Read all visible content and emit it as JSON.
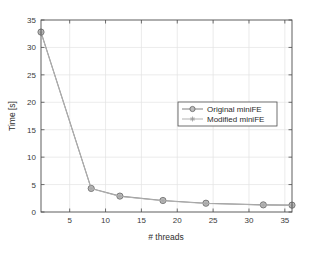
{
  "chart_data": {
    "type": "line",
    "title": "",
    "xlabel": "# threads",
    "ylabel": "Time [s]",
    "xlim": [
      1,
      36
    ],
    "ylim": [
      0,
      35
    ],
    "xticks": [
      5,
      10,
      15,
      20,
      25,
      30,
      35
    ],
    "xtick_labels": [
      "5",
      "10",
      "15",
      "20",
      "25",
      "30",
      "35"
    ],
    "yticks": [
      0,
      5,
      10,
      15,
      20,
      25,
      30,
      35
    ],
    "ytick_labels": [
      "0",
      "5",
      "10",
      "15",
      "20",
      "25",
      "30",
      "35"
    ],
    "grid": true,
    "legend_position": "center-right",
    "x": [
      1,
      8,
      12,
      18,
      24,
      32,
      36
    ],
    "series": [
      {
        "name": "Original miniFE",
        "values": [
          32.8,
          4.3,
          2.9,
          2.1,
          1.6,
          1.3,
          1.25
        ],
        "color": "#8a8a8a",
        "marker": "circle"
      },
      {
        "name": "Modified miniFE",
        "values": [
          32.7,
          4.25,
          2.85,
          2.05,
          1.55,
          1.28,
          1.2
        ],
        "color": "#b0b0b0",
        "marker": "star"
      }
    ]
  },
  "legend": {
    "entries": [
      {
        "label": "Original miniFE",
        "marker_name": "circle-marker-icon"
      },
      {
        "label": "Modified miniFE",
        "marker_name": "star-marker-icon"
      }
    ]
  },
  "axes": {
    "x_axis_label": "# threads",
    "y_axis_label": "Time [s]"
  },
  "colors": {
    "plot_background": "#ffffff",
    "page_background": "#ffffff",
    "axis_line": "#4d4d4d",
    "grid_line": "#e2e2e2",
    "series_1": "#8a8a8a",
    "series_2": "#b0b0b0",
    "text": "#2e2e2e"
  }
}
